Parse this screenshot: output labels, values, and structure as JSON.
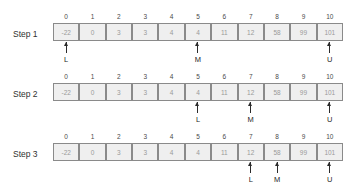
{
  "diagram": {
    "array_values": [
      "-22",
      "0",
      "3",
      "3",
      "4",
      "4",
      "11",
      "12",
      "58",
      "99",
      "101"
    ],
    "indices": [
      "0",
      "1",
      "2",
      "3",
      "4",
      "5",
      "6",
      "7",
      "8",
      "9",
      "10"
    ],
    "pointer_labels": {
      "lower": "L",
      "middle": "M",
      "upper": "U"
    },
    "colors": {
      "cell_fill": "#efefef",
      "cell_border": "#8a8a8a",
      "cell_text": "#9a9a9a",
      "index_text": "#4a4a4a",
      "pointer": "#2b2b2b",
      "label_text": "#303030",
      "background": "#ffffff"
    },
    "steps": [
      {
        "label": "Step 1",
        "pointers": [
          {
            "index": 0,
            "label": "L"
          },
          {
            "index": 5,
            "label": "M"
          },
          {
            "index": 10,
            "label": "U"
          }
        ]
      },
      {
        "label": "Step 2",
        "pointers": [
          {
            "index": 5,
            "label": "L"
          },
          {
            "index": 7,
            "label": "M"
          },
          {
            "index": 10,
            "label": "U"
          }
        ]
      },
      {
        "label": "Step 3",
        "pointers": [
          {
            "index": 7,
            "label": "L"
          },
          {
            "index": 8,
            "label": "M"
          },
          {
            "index": 10,
            "label": "U"
          }
        ]
      }
    ]
  }
}
